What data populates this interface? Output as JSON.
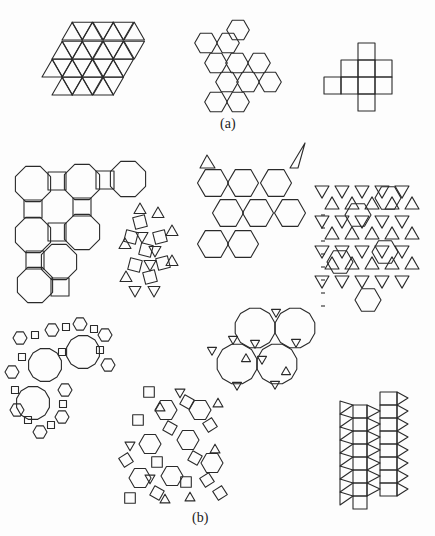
{
  "labels": {
    "a": "(a)",
    "b": "(b)"
  },
  "style": {
    "stroke": "#2a2a2a",
    "stroke_width": 1.1,
    "background": "#fdfdfd"
  },
  "figures": [
    {
      "name": "triangle-tiling",
      "part": "a",
      "type": "triangular",
      "x0": 42,
      "y0": 95,
      "side": 20.5,
      "rows": [
        {
          "row": 0,
          "from": 1,
          "to": 8
        },
        {
          "row": 1,
          "from": 0,
          "to": 8
        },
        {
          "row": 2,
          "from": 1,
          "to": 10
        },
        {
          "row": 3,
          "from": 4,
          "to": 6
        },
        {
          "row": 3,
          "from": 7,
          "to": 9
        }
      ]
    },
    {
      "name": "hexagon-tiling",
      "part": "a",
      "type": "hexagonal",
      "r": 11.3,
      "cells": [
        [
          238,
          30
        ],
        [
          206,
          43
        ],
        [
          228,
          43
        ],
        [
          216,
          63
        ],
        [
          237,
          63
        ],
        [
          259,
          63
        ],
        [
          227,
          82
        ],
        [
          248,
          82
        ],
        [
          270,
          82
        ],
        [
          216,
          102
        ],
        [
          238,
          102
        ]
      ]
    },
    {
      "name": "square-tiling",
      "part": "a",
      "type": "squares",
      "size": 17,
      "cells": [
        [
          358,
          43
        ],
        [
          341,
          60
        ],
        [
          358,
          60
        ],
        [
          375,
          60
        ],
        [
          324,
          77
        ],
        [
          341,
          77
        ],
        [
          358,
          77
        ],
        [
          375,
          77
        ],
        [
          358,
          94
        ]
      ]
    },
    {
      "name": "truncated-square-tiling",
      "part": "b",
      "type": "oct4",
      "r": 19,
      "octs": [
        [
          33,
          184
        ],
        [
          82,
          182
        ],
        [
          128,
          179
        ],
        [
          33,
          235
        ],
        [
          82,
          232
        ],
        [
          35,
          285
        ],
        [
          59,
          262
        ]
      ],
      "squares": [
        [
          57,
          181,
          10
        ],
        [
          105,
          180,
          10
        ],
        [
          33,
          209,
          10
        ],
        [
          82,
          207,
          10
        ],
        [
          57,
          232,
          10
        ],
        [
          35,
          260,
          10
        ],
        [
          60,
          287,
          10
        ]
      ]
    },
    {
      "name": "snub-square-tiling",
      "part": "b",
      "type": "snub",
      "cx": 152,
      "cy": 252,
      "w": 58,
      "h": 95
    },
    {
      "name": "trihexagonal-tiling",
      "part": "b",
      "type": "kagome",
      "ys": [
        168,
        198,
        229
      ],
      "x0": 198,
      "x1": 305,
      "bottom": 260
    },
    {
      "name": "rhombitrihexagonal-square-tiling",
      "part": "b",
      "type": "patch",
      "x": 318,
      "y": 175,
      "w": 100,
      "h": 140
    },
    {
      "name": "truncated-trihexagonal-tiling",
      "part": "b",
      "type": "dodeca-hex",
      "x": 5,
      "y": 325,
      "w": 115,
      "h": 125
    },
    {
      "name": "rhombitrihexagonal-tiling",
      "part": "b",
      "type": "patch2",
      "x": 112,
      "y": 380,
      "w": 110,
      "h": 120
    },
    {
      "name": "truncated-hexagonal-tiling",
      "part": "b",
      "type": "dodeca3",
      "dods": [
        [
          255,
          328
        ],
        [
          295,
          328
        ],
        [
          237,
          364
        ],
        [
          277,
          364
        ]
      ],
      "r": 20.5
    },
    {
      "name": "elongated-triangular-tiling",
      "part": "b",
      "type": "elongated",
      "x": 340,
      "y": 400,
      "w": 75,
      "h": 95
    }
  ]
}
